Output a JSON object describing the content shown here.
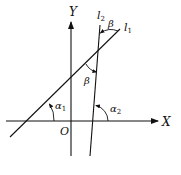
{
  "diagram": {
    "type": "geometry",
    "axes": {
      "x_label": "X",
      "y_label": "Y",
      "origin_label": "O"
    },
    "lines": [
      {
        "id": "l1",
        "label": "l",
        "subscript": "1"
      },
      {
        "id": "l2",
        "label": "l",
        "subscript": "2"
      }
    ],
    "angles": {
      "alpha1": {
        "symbol": "α",
        "subscript": "1"
      },
      "alpha2": {
        "symbol": "α",
        "subscript": "2"
      },
      "beta_top": {
        "symbol": "β"
      },
      "beta_mid": {
        "symbol": "β"
      }
    },
    "colors": {
      "stroke": "#111111",
      "background": "#ffffff"
    }
  }
}
